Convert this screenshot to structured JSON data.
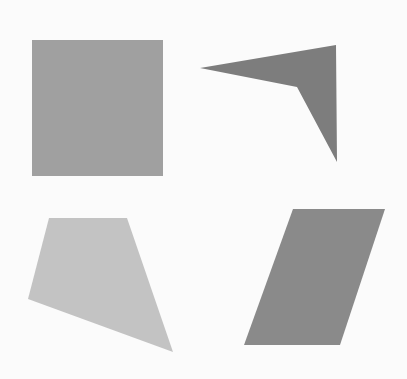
{
  "canvas": {
    "width": 407,
    "height": 379,
    "background": "#fbfbfb"
  },
  "shapes": [
    {
      "id": "square",
      "type": "square",
      "points": "32,40 163,40 163,176 32,176",
      "fill": "#a0a0a0"
    },
    {
      "id": "concave-quadrilateral",
      "type": "concave-quadrilateral",
      "points": "200,68 336,45 337,162 297,87",
      "fill": "#7d7d7d"
    },
    {
      "id": "quadrilateral",
      "type": "quadrilateral",
      "points": "49,218 127,218 173,352 28,299",
      "fill": "#c3c3c3"
    },
    {
      "id": "parallelogram",
      "type": "parallelogram",
      "points": "293,209 385,209 340,345 244,345",
      "fill": "#8a8a8a"
    }
  ]
}
